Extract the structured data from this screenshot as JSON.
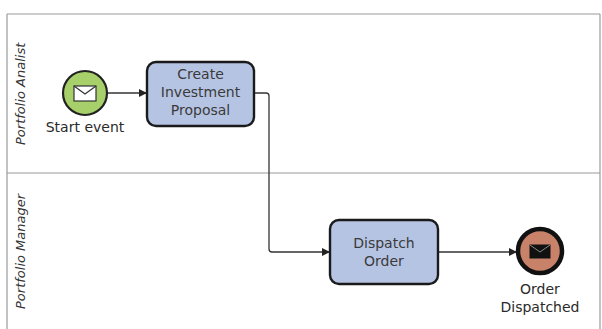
{
  "diagram": {
    "type": "BPMN process with swimlanes",
    "lanes": [
      {
        "id": "lane-analyst",
        "label": "Portfolio Analist"
      },
      {
        "id": "lane-manager",
        "label": "Portfolio Manager"
      }
    ],
    "nodes": {
      "start_event": {
        "kind": "message start event",
        "label": "Start event",
        "fill": "#a8d06a",
        "icon": "envelope-icon"
      },
      "task_create": {
        "kind": "task",
        "lines": [
          "Create",
          "Investment",
          "Proposal"
        ],
        "fill": "#b6c4e4"
      },
      "task_dispatch": {
        "kind": "task",
        "lines": [
          "Dispatch",
          "Order"
        ],
        "fill": "#b6c4e4"
      },
      "end_event": {
        "kind": "message end event",
        "lines": [
          "Order",
          "Dispatched"
        ],
        "fill": "#c8826a",
        "icon": "envelope-filled-icon"
      }
    },
    "edges": [
      {
        "from": "Start event",
        "to": "Create Investment Proposal"
      },
      {
        "from": "Create Investment Proposal",
        "to": "Dispatch Order"
      },
      {
        "from": "Dispatch Order",
        "to": "Order Dispatched"
      }
    ],
    "colors": {
      "lane_border": "#9a9a9a",
      "task_border": "#1a1a1a",
      "connector": "#333333"
    }
  }
}
